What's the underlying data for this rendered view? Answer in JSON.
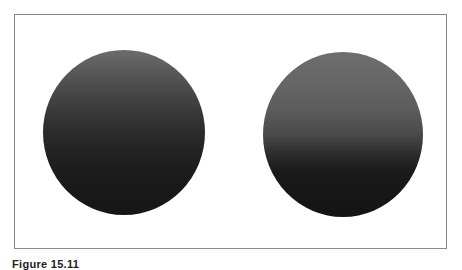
{
  "figure": {
    "caption": "Figure 15.11",
    "frame_border_color": "#8a8a8a",
    "background_color": "#ffffff"
  },
  "spheres": [
    {
      "id": "left",
      "description": "Shaded sphere with smooth, gradual top-to-bottom gradient",
      "gradient_top": "#6c6c6c",
      "gradient_bottom": "#161616"
    },
    {
      "id": "right",
      "description": "Shaded sphere with lighter upper region and sharper transition to dark lower half",
      "gradient_top": "#6e6e6e",
      "gradient_bottom": "#141414"
    }
  ]
}
